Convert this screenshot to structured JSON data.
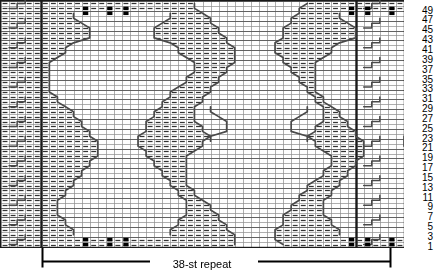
{
  "chart_data": {
    "type": "table",
    "xlabel": "stitches",
    "ylabel": "rows",
    "grid": true,
    "columns": 50,
    "rows": 50,
    "row_number_side": "right",
    "row_numbers": [
      49,
      47,
      45,
      43,
      41,
      39,
      37,
      35,
      33,
      31,
      29,
      27,
      25,
      23,
      21,
      19,
      17,
      15,
      13,
      11,
      9,
      7,
      5,
      3,
      1
    ],
    "row_numbers_note": "odd rows labelled, 1 at bottom through 49 at top",
    "repeat_start_column": 6,
    "repeat_end_column": 43,
    "repeat_width_stitches": 38,
    "symbols": {
      "purl": "horizontal dash in cell",
      "knit": "empty cell",
      "bobble": "filled black square",
      "cable": "diagonal / stepped line crossing cells"
    },
    "bobble_cells": [
      {
        "row": 49,
        "col": 11
      },
      {
        "row": 49,
        "col": 14
      },
      {
        "row": 49,
        "col": 16
      },
      {
        "row": 48,
        "col": 11
      },
      {
        "row": 48,
        "col": 14
      },
      {
        "row": 48,
        "col": 16
      },
      {
        "row": 49,
        "col": 44
      },
      {
        "row": 49,
        "col": 46
      },
      {
        "row": 49,
        "col": 49
      },
      {
        "row": 48,
        "col": 44
      },
      {
        "row": 48,
        "col": 46
      },
      {
        "row": 48,
        "col": 49
      },
      {
        "row": 2,
        "col": 11
      },
      {
        "row": 2,
        "col": 14
      },
      {
        "row": 2,
        "col": 16
      },
      {
        "row": 1,
        "col": 11
      },
      {
        "row": 1,
        "col": 14
      },
      {
        "row": 1,
        "col": 16
      },
      {
        "row": 2,
        "col": 44
      },
      {
        "row": 2,
        "col": 46
      },
      {
        "row": 2,
        "col": 49
      },
      {
        "row": 1,
        "col": 44
      },
      {
        "row": 1,
        "col": 46
      },
      {
        "row": 1,
        "col": 49
      }
    ],
    "colors": {
      "grid_line": "#8c8c8c",
      "heavy_line": "#1a1a1a",
      "symbol": "#333333",
      "bobble_fill": "#000000",
      "background": "#ffffff"
    }
  },
  "caption": {
    "repeat_label": "38-st repeat"
  }
}
